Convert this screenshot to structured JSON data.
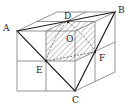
{
  "figure": {
    "labels": {
      "A": "A",
      "B": "B",
      "C": "C",
      "D": "D",
      "E": "E",
      "F": "F",
      "O": "O"
    },
    "colors": {
      "line": "#555555",
      "bold": "#222222",
      "hatch": "#777777"
    }
  }
}
